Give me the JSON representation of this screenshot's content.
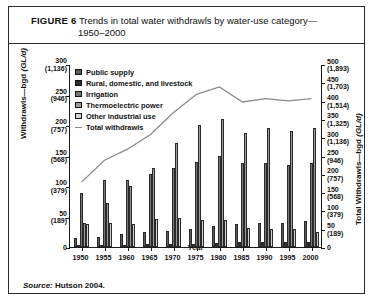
{
  "figure": {
    "label": "FIGURE 6",
    "title_line1": "Trends in total water withdrawls by water-use category—",
    "title_line2": "1950–2000",
    "source_prefix": "Source:",
    "source_text": " Hutson 2004."
  },
  "axis_titles": {
    "left": "Withdrawls—bgd (GL/d)",
    "left_plain": "Withdrawls—bgd ",
    "left_italic": "(GL/d)",
    "right_plain": "Total Withdrawls—bgd ",
    "right_italic": "(GL/d)",
    "x": "Year"
  },
  "legend": {
    "items": [
      {
        "label": "Public supply",
        "color": "#5a5a5a",
        "type": "bar"
      },
      {
        "label": "Rural, domestic, and livestock",
        "color": "#2e2e2e",
        "type": "bar"
      },
      {
        "label": "Irrigation",
        "color": "#777777",
        "type": "bar"
      },
      {
        "label": "Thermoelectric power",
        "color": "#9a9a9a",
        "type": "bar"
      },
      {
        "label": "Other industrial use",
        "color": "#d2d2d2",
        "type": "bar"
      },
      {
        "label": "Total withdrawls",
        "color": "#8a8a8a",
        "type": "line"
      }
    ]
  },
  "chart_data": {
    "type": "bar",
    "xlabel": "Year",
    "ylabel": "Withdrawls—bgd (GL/d)",
    "y2label": "Total Withdrawls—bgd (GL/d)",
    "grid": false,
    "legend_position": "top-left",
    "categories": [
      1950,
      1955,
      1960,
      1965,
      1970,
      1975,
      1980,
      1985,
      1990,
      1995,
      2000
    ],
    "xtick_labels": [
      "1950",
      "1955",
      "1960",
      "1965",
      "1970",
      "1975",
      "1980",
      "1985",
      "1990",
      "1995",
      "2000"
    ],
    "ylim": [
      0,
      300
    ],
    "yticks": [
      0,
      50,
      100,
      150,
      200,
      250,
      300
    ],
    "ytick_labels": [
      {
        "bgd": "0",
        "gl": ""
      },
      {
        "bgd": "50",
        "gl": "(189)"
      },
      {
        "bgd": "100",
        "gl": "(379)"
      },
      {
        "bgd": "150",
        "gl": "(568)"
      },
      {
        "bgd": "200",
        "gl": "(757)"
      },
      {
        "bgd": "250",
        "gl": "(946)"
      },
      {
        "bgd": "300",
        "gl": "(1,136)"
      }
    ],
    "y2lim": [
      0,
      500
    ],
    "y2ticks": [
      0,
      50,
      100,
      150,
      200,
      250,
      300,
      350,
      400,
      450,
      500
    ],
    "y2tick_labels": [
      {
        "bgd": "0",
        "gl": ""
      },
      {
        "bgd": "50",
        "gl": "(189)"
      },
      {
        "bgd": "100",
        "gl": "(379)"
      },
      {
        "bgd": "150",
        "gl": "(568)"
      },
      {
        "bgd": "200",
        "gl": "(757)"
      },
      {
        "bgd": "250",
        "gl": "(946)"
      },
      {
        "bgd": "300",
        "gl": "(1,136)"
      },
      {
        "bgd": "350",
        "gl": "(1,325)"
      },
      {
        "bgd": "400",
        "gl": "(1,514)"
      },
      {
        "bgd": "450",
        "gl": "(1,703)"
      },
      {
        "bgd": "500",
        "gl": "(1,893)"
      }
    ],
    "series": [
      {
        "name": "Public supply",
        "color": "#5a5a5a",
        "axis": "left",
        "values": [
          14,
          17,
          21,
          24,
          27,
          29,
          34,
          37,
          39,
          40,
          43
        ]
      },
      {
        "name": "Rural, domestic, and livestock",
        "color": "#2e2e2e",
        "axis": "left",
        "values": [
          4,
          4,
          4,
          5,
          5,
          5,
          6,
          8,
          8,
          9,
          9
        ]
      },
      {
        "name": "Irrigation",
        "color": "#777777",
        "axis": "left",
        "values": [
          89,
          110,
          110,
          120,
          130,
          140,
          150,
          137,
          137,
          134,
          137
        ]
      },
      {
        "name": "Thermoelectric power",
        "color": "#9a9a9a",
        "axis": "left",
        "values": [
          40,
          72,
          100,
          130,
          170,
          200,
          210,
          187,
          195,
          190,
          195
        ]
      },
      {
        "name": "Other industrial use",
        "color": "#d2d2d2",
        "axis": "left",
        "values": [
          37,
          39,
          38,
          46,
          47,
          45,
          45,
          31,
          30,
          29,
          24
        ]
      },
      {
        "name": "Total withdrawls",
        "color": "#8a8a8a",
        "axis": "right",
        "type": "line",
        "values": [
          180,
          240,
          270,
          310,
          370,
          420,
          440,
          399,
          408,
          402,
          408
        ]
      }
    ]
  }
}
